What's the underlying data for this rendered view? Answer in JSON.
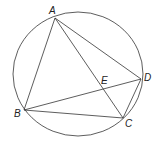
{
  "diagram": {
    "type": "inscribed quadrilateral with intersecting diagonals",
    "circle": {
      "cx": 78,
      "cy": 74,
      "rx": 65,
      "ry": 62
    },
    "points": [
      {
        "name": "A",
        "x": 55,
        "y": 18,
        "lx": 49,
        "ly": 14
      },
      {
        "name": "B",
        "x": 24,
        "y": 110,
        "lx": 14,
        "ly": 117
      },
      {
        "name": "C",
        "x": 123,
        "y": 118,
        "lx": 125,
        "ly": 127
      },
      {
        "name": "D",
        "x": 141,
        "y": 79,
        "lx": 144,
        "ly": 81
      },
      {
        "name": "E",
        "x": 104,
        "y": 89,
        "lx": 101,
        "ly": 84
      }
    ],
    "segments": [
      "AB",
      "AC",
      "AD",
      "BC",
      "BD",
      "CD"
    ],
    "colors": {
      "stroke": "#333333",
      "label": "#222222"
    }
  }
}
